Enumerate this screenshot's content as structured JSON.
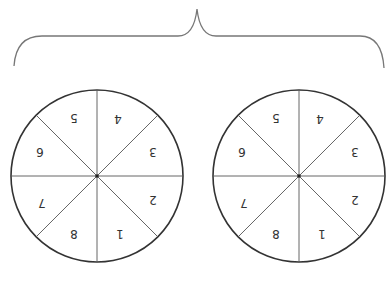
{
  "diagram": {
    "orientation": "rotated-180",
    "brace": {
      "color": "#777777"
    },
    "circles": [
      {
        "id": "left",
        "cx": 97,
        "cy": 176,
        "r": 86,
        "segments": [
          "1",
          "2",
          "3",
          "4",
          "5",
          "6",
          "7",
          "8"
        ]
      },
      {
        "id": "right",
        "cx": 299,
        "cy": 176,
        "r": 86,
        "segments": [
          "1",
          "2",
          "3",
          "4",
          "5",
          "6",
          "7",
          "8"
        ]
      }
    ],
    "colors": {
      "outline": "#333333",
      "divider": "#555555"
    }
  }
}
